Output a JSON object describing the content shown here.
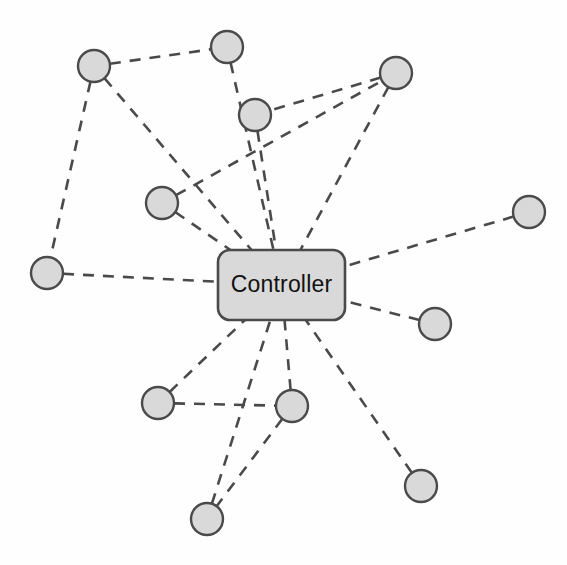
{
  "diagram": {
    "background_color": "#fefefe",
    "hub": {
      "label": "Controller",
      "x": 281.5,
      "y": 285,
      "width": 127,
      "height": 70,
      "corner_radius": 12,
      "fill_color": "#d9d9d9",
      "stroke_color": "#4a4a4a",
      "text_color": "#111111"
    },
    "node_style": {
      "radius": 16,
      "fill_color": "#d9d9d9",
      "stroke_color": "#4a4a4a"
    },
    "edge_style": {
      "stroke_color": "#4a4a4a",
      "stroke_width": 2.6,
      "dash_pattern": "11 9",
      "line_type": "dashed"
    },
    "nodes": [
      {
        "id": "n1",
        "name": "node-top-left",
        "x": 94,
        "y": 66
      },
      {
        "id": "n2",
        "name": "node-top-center",
        "x": 227,
        "y": 47
      },
      {
        "id": "n3",
        "name": "node-top-right",
        "x": 396,
        "y": 73
      },
      {
        "id": "n4",
        "name": "node-upper-center",
        "x": 255,
        "y": 115
      },
      {
        "id": "n5",
        "name": "node-mid-left",
        "x": 162,
        "y": 203
      },
      {
        "id": "n6",
        "name": "node-far-left",
        "x": 47,
        "y": 273
      },
      {
        "id": "n7",
        "name": "node-far-right",
        "x": 529,
        "y": 212
      },
      {
        "id": "n8",
        "name": "node-right-lower",
        "x": 435,
        "y": 324
      },
      {
        "id": "n9",
        "name": "node-bottom-left",
        "x": 158,
        "y": 403
      },
      {
        "id": "n10",
        "name": "node-bottom-center",
        "x": 292,
        "y": 406
      },
      {
        "id": "n11",
        "name": "node-bottom",
        "x": 207,
        "y": 519
      },
      {
        "id": "n12",
        "name": "node-bottom-right",
        "x": 421,
        "y": 486
      }
    ],
    "edges": [
      {
        "id": "e1",
        "from": "n1",
        "to": "n2",
        "name": "edge-topleft-topcenter"
      },
      {
        "id": "e2",
        "from": "n1",
        "to": "n6",
        "name": "edge-topleft-farleft"
      },
      {
        "id": "e3",
        "from": "n1",
        "to": "hub",
        "name": "edge-topleft-controller"
      },
      {
        "id": "e4",
        "from": "n2",
        "to": "hub",
        "name": "edge-topcenter-controller"
      },
      {
        "id": "e5",
        "from": "n3",
        "to": "n4",
        "name": "edge-topright-uppercenter"
      },
      {
        "id": "e6",
        "from": "n3",
        "to": "hub",
        "name": "edge-topright-controller"
      },
      {
        "id": "e7",
        "from": "n4",
        "to": "hub",
        "name": "edge-uppercenter-controller"
      },
      {
        "id": "e8",
        "from": "n5",
        "to": "n3",
        "name": "edge-midleft-topright"
      },
      {
        "id": "e9",
        "from": "n5",
        "to": "hub",
        "name": "edge-midleft-controller"
      },
      {
        "id": "e10",
        "from": "n6",
        "to": "hub",
        "name": "edge-farleft-controller"
      },
      {
        "id": "e11",
        "from": "n7",
        "to": "hub",
        "name": "edge-farright-controller"
      },
      {
        "id": "e12",
        "from": "n8",
        "to": "hub",
        "name": "edge-rightlower-controller"
      },
      {
        "id": "e13",
        "from": "n9",
        "to": "n10",
        "name": "edge-bottomleft-bottomcenter"
      },
      {
        "id": "e14",
        "from": "n9",
        "to": "hub",
        "name": "edge-bottomleft-controller"
      },
      {
        "id": "e15",
        "from": "n10",
        "to": "hub",
        "name": "edge-bottomcenter-controller"
      },
      {
        "id": "e16",
        "from": "n10",
        "to": "n11",
        "name": "edge-bottomcenter-bottom"
      },
      {
        "id": "e17",
        "from": "n11",
        "to": "hub",
        "name": "edge-bottom-controller"
      },
      {
        "id": "e18",
        "from": "n12",
        "to": "hub",
        "name": "edge-bottomright-controller"
      }
    ]
  }
}
